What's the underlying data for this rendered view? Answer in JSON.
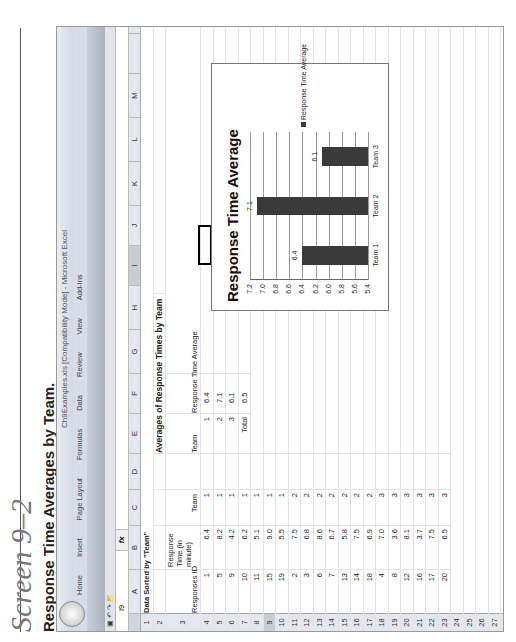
{
  "caption": "Screen 9–2",
  "subtitle": "Response Time Averages by Team.",
  "window": {
    "title": "Ch9Examples.xls [Compatibility Mode] - Microsoft Excel",
    "tabs": [
      "Home",
      "Insert",
      "Page Layout",
      "Formulas",
      "Data",
      "Review",
      "View",
      "Add-Ins"
    ],
    "name_box": "I9",
    "fx_label": "fx",
    "formula": ""
  },
  "columns": [
    "A",
    "B",
    "C",
    "D",
    "E",
    "F",
    "G",
    "H",
    "I",
    "J",
    "K",
    "L",
    "M"
  ],
  "sheet": {
    "a1": "Data Sorted by \"Team\"",
    "header_row": {
      "a": "Responses ID",
      "b": "Response Time (in minute)",
      "c": "Team"
    },
    "rows": [
      {
        "n": "4",
        "id": "1",
        "time": "6.4",
        "team": "1"
      },
      {
        "n": "5",
        "id": "5",
        "time": "8.2",
        "team": "1"
      },
      {
        "n": "6",
        "id": "9",
        "time": "4.2",
        "team": "1"
      },
      {
        "n": "7",
        "id": "10",
        "time": "6.2",
        "team": "1"
      },
      {
        "n": "8",
        "id": "11",
        "time": "5.1",
        "team": "1"
      },
      {
        "n": "9",
        "id": "15",
        "time": "9.0",
        "team": "1"
      },
      {
        "n": "10",
        "id": "19",
        "time": "5.5",
        "team": "1"
      },
      {
        "n": "11",
        "id": "2",
        "time": "7.5",
        "team": "2"
      },
      {
        "n": "12",
        "id": "3",
        "time": "6.8",
        "team": "2"
      },
      {
        "n": "13",
        "id": "6",
        "time": "8.6",
        "team": "2"
      },
      {
        "n": "14",
        "id": "7",
        "time": "6.7",
        "team": "2"
      },
      {
        "n": "15",
        "id": "13",
        "time": "5.8",
        "team": "2"
      },
      {
        "n": "16",
        "id": "14",
        "time": "7.5",
        "team": "2"
      },
      {
        "n": "17",
        "id": "18",
        "time": "6.9",
        "team": "2"
      },
      {
        "n": "18",
        "id": "4",
        "time": "7.0",
        "team": "3"
      },
      {
        "n": "19",
        "id": "8",
        "time": "3.6",
        "team": "3"
      },
      {
        "n": "20",
        "id": "12",
        "time": "8.1",
        "team": "3"
      },
      {
        "n": "21",
        "id": "16",
        "time": "3.7",
        "team": "3"
      },
      {
        "n": "22",
        "id": "17",
        "time": "7.5",
        "team": "3"
      },
      {
        "n": "23",
        "id": "20",
        "time": "6.5",
        "team": "3"
      }
    ],
    "empty_rows": [
      "24",
      "25",
      "26",
      "27",
      "28",
      "29",
      "30",
      "31",
      "32",
      "33",
      "34"
    ],
    "pivot": {
      "title": "Averages of Response Times by Team",
      "col1": "Team",
      "col2": "Response Time Average",
      "rows": [
        {
          "team": "1",
          "avg": "6.4"
        },
        {
          "team": "2",
          "avg": "7.1"
        },
        {
          "team": "3",
          "avg": "6.1"
        },
        {
          "team": "Total",
          "avg": "6.5"
        }
      ]
    }
  },
  "chart_data": {
    "type": "bar",
    "title": "Response Time Average",
    "categories": [
      "Team 1",
      "Team 2",
      "Team 3"
    ],
    "series": [
      {
        "name": "Response Time Average",
        "values": [
          6.4,
          7.1,
          6.1
        ]
      }
    ],
    "data_labels": [
      "6.4",
      "7.1",
      "6.1"
    ],
    "yticks": [
      "7.2",
      "7.0",
      "6.8",
      "6.6",
      "6.4",
      "6.2",
      "6.0",
      "5.8",
      "5.6",
      "5.4"
    ],
    "ylim": [
      5.4,
      7.2
    ],
    "xlabel": "",
    "ylabel": "",
    "grid": true,
    "legend_position": "right",
    "bar_color": "#3a3a3a"
  }
}
